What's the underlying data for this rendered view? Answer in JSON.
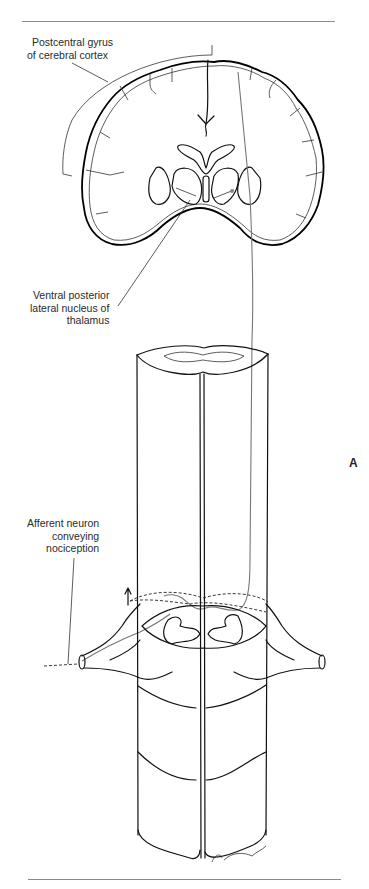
{
  "figure": {
    "panel_letter": "A",
    "labels": {
      "postcentral_gyrus": [
        "Postcentral gyrus",
        "of cerebral cortex"
      ],
      "vpl_thalamus": [
        "Ventral posterior",
        "lateral nucleus of",
        "thalamus"
      ],
      "afferent_neuron": [
        "Afferent neuron",
        "conveying",
        "nociception"
      ]
    },
    "signature": "Cumming '94"
  },
  "colors": {
    "line": "#111111",
    "rule": "#8a8a8a",
    "pathway": "#777777",
    "background": "#ffffff"
  }
}
